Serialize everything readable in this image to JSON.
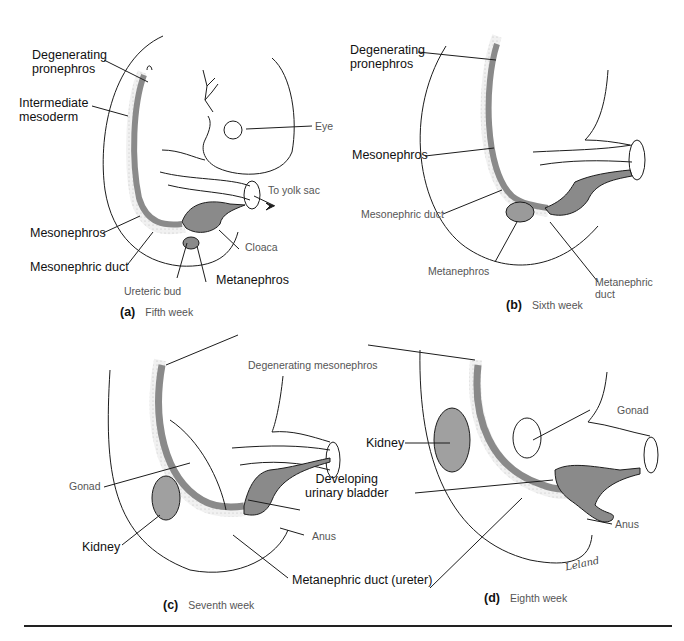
{
  "figure": {
    "colors": {
      "tissue": "#8a8a8a",
      "stipple": "#e9e9e9",
      "line": "#1c1c1c",
      "rule": "#222222"
    },
    "panels": [
      {
        "id": "a",
        "letter": "(a)",
        "caption": "Fifth week",
        "labels": {
          "degenerating_pronephros": "Degenerating\npronephros",
          "intermediate_mesoderm": "Intermediate\nmesoderm",
          "eye": "Eye",
          "to_yolk_sac": "To yolk sac",
          "mesonephros": "Mesonephros",
          "mesonephric_duct": "Mesonephric duct",
          "cloaca": "Cloaca",
          "ureteric_bud": "Ureteric bud",
          "metanephros": "Metanephros"
        }
      },
      {
        "id": "b",
        "letter": "(b)",
        "caption": "Sixth week",
        "labels": {
          "degenerating_pronephros": "Degenerating\npronephros",
          "mesonephros": "Mesonephros",
          "mesonephric_duct": "Mesonephric duct",
          "metanephros": "Metanephros",
          "metanephric_duct": "Metanephric\nduct"
        }
      },
      {
        "id": "c",
        "letter": "(c)",
        "caption": "Seventh week",
        "labels": {
          "gonad": "Gonad",
          "kidney": "Kidney",
          "anus": "Anus"
        }
      },
      {
        "id": "d",
        "letter": "(d)",
        "caption": "Eighth week",
        "labels": {
          "gonad": "Gonad",
          "kidney": "Kidney",
          "anus": "Anus",
          "signature": "Leland"
        }
      }
    ],
    "shared_labels": {
      "degenerating_mesonephros": "Degenerating mesonephros",
      "developing_urinary_bladder": "Developing\nurinary bladder",
      "metanephric_duct_ureter": "Metanephric duct (ureter)"
    }
  }
}
